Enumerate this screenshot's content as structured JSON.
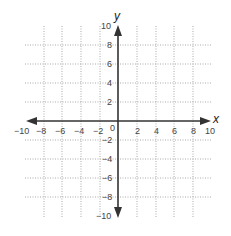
{
  "diagram": {
    "type": "coordinate-plane",
    "x_axis": {
      "label": "x",
      "min": -10,
      "max": 10,
      "tick_step": 2,
      "tick_labels": [
        "−10",
        "−8",
        "−6",
        "−4",
        "−2",
        "2",
        "4",
        "6",
        "8",
        "10"
      ]
    },
    "y_axis": {
      "label": "y",
      "min": -10,
      "max": 10,
      "tick_step": 2,
      "tick_labels": [
        "10",
        "8",
        "6",
        "4",
        "2",
        "−2",
        "−4",
        "−6",
        "−8",
        "−10"
      ]
    },
    "origin_label": "0",
    "grid": "dotted",
    "colors": {
      "axis": "#333333",
      "grid": "#aaaaaa",
      "text": "#444444"
    }
  }
}
